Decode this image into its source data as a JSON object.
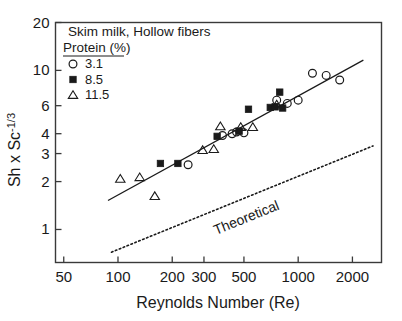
{
  "chart_data": {
    "type": "scatter",
    "title": "",
    "xlabel": "Reynolds Number (Re)",
    "ylabel": "Sh x Sc-1/3",
    "ylabel_base": "Sh x Sc",
    "ylabel_exp": "-1/3",
    "xscale": "log",
    "yscale": "log",
    "xlim": [
      45,
      2900
    ],
    "ylim": [
      0.62,
      20
    ],
    "grid": false,
    "xticks": [
      50,
      100,
      200,
      300,
      500,
      1000,
      2000
    ],
    "xticklabels": [
      "50",
      "100",
      "200",
      "300",
      "500",
      "1000",
      "2000"
    ],
    "yticks": [
      1,
      2,
      3,
      4,
      6,
      10,
      20
    ],
    "yticklabels": [
      "1",
      "2",
      "3",
      "4",
      "6",
      "10",
      "20"
    ],
    "legend_position": "upper-left",
    "legend_title_line1": "Skim milk,  Hollow fibers",
    "legend_title_line2": "Protein (%)",
    "series": [
      {
        "name": "3.1",
        "marker": "open-circle",
        "points": [
          [
            245,
            2.55
          ],
          [
            380,
            3.9
          ],
          [
            430,
            4.0
          ],
          [
            455,
            4.1
          ],
          [
            500,
            4.05
          ],
          [
            760,
            6.5
          ],
          [
            870,
            6.2
          ],
          [
            1000,
            6.5
          ],
          [
            1200,
            9.6
          ],
          [
            1430,
            9.3
          ],
          [
            1700,
            8.7
          ]
        ]
      },
      {
        "name": "8.5",
        "marker": "filled-square",
        "points": [
          [
            172,
            2.6
          ],
          [
            215,
            2.6
          ],
          [
            355,
            3.85
          ],
          [
            470,
            4.15
          ],
          [
            530,
            5.7
          ],
          [
            700,
            5.85
          ],
          [
            745,
            5.9
          ],
          [
            790,
            7.3
          ],
          [
            820,
            5.8
          ]
        ]
      },
      {
        "name": "11.5",
        "marker": "open-triangle",
        "points": [
          [
            103,
            2.08
          ],
          [
            132,
            2.13
          ],
          [
            160,
            1.62
          ],
          [
            295,
            3.15
          ],
          [
            340,
            3.2
          ],
          [
            370,
            4.45
          ],
          [
            480,
            4.4
          ],
          [
            560,
            4.4
          ],
          [
            760,
            6.1
          ]
        ]
      }
    ],
    "annotations": [
      {
        "text": "Theoretical",
        "kind": "line-label",
        "rotation_deg": -22
      }
    ],
    "lines": [
      {
        "name": "experimental-fit",
        "style": "solid",
        "from": [
          88,
          1.52
        ],
        "to": [
          2300,
          11.6
        ]
      },
      {
        "name": "theoretical",
        "style": "dotted",
        "from": [
          92,
          0.72
        ],
        "to": [
          2600,
          3.35
        ]
      }
    ]
  },
  "legend": {
    "entries": [
      {
        "label": "3.1",
        "marker": "open-circle"
      },
      {
        "label": "8.5",
        "marker": "filled-square"
      },
      {
        "label": "11.5",
        "marker": "open-triangle"
      }
    ]
  }
}
